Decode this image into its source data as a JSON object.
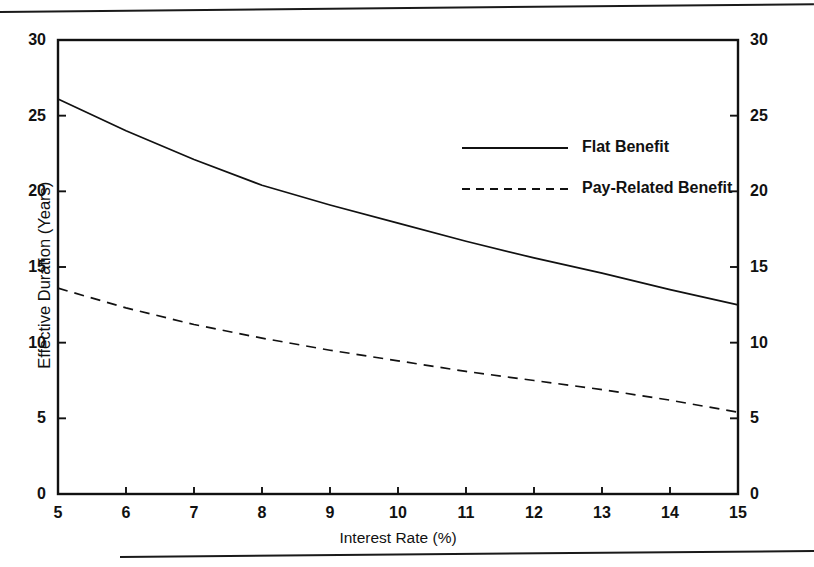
{
  "chart_data": {
    "type": "line",
    "title": "",
    "xlabel": "Interest Rate (%)",
    "ylabel": "Effective Duration (Years)",
    "xlim": [
      5,
      15
    ],
    "ylim": [
      0,
      30
    ],
    "grid": false,
    "legend_position": "upper-right-inside",
    "x_ticks": [
      "5",
      "6",
      "7",
      "8",
      "9",
      "10",
      "11",
      "12",
      "13",
      "14",
      "15"
    ],
    "y_ticks": [
      "0",
      "5",
      "10",
      "15",
      "20",
      "25",
      "30"
    ],
    "y_ticks_right": [
      "0",
      "5",
      "10",
      "15",
      "20",
      "25",
      "30"
    ],
    "x": [
      5,
      6,
      7,
      8,
      9,
      10,
      11,
      12,
      13,
      14,
      15
    ],
    "series": [
      {
        "name": "Flat Benefit",
        "style": "solid",
        "color": "#111111",
        "values": [
          26.1,
          24.0,
          22.1,
          20.4,
          19.1,
          17.9,
          16.7,
          15.6,
          14.6,
          13.5,
          12.5
        ]
      },
      {
        "name": "Pay-Related Benefit",
        "style": "dashed",
        "color": "#111111",
        "values": [
          13.6,
          12.3,
          11.2,
          10.3,
          9.5,
          8.8,
          8.1,
          7.5,
          6.9,
          6.2,
          5.4
        ]
      }
    ]
  },
  "legend": {
    "items": [
      {
        "label": "Flat Benefit",
        "style": "solid"
      },
      {
        "label": "Pay-Related Benefit",
        "style": "dashed"
      }
    ]
  },
  "axes": {
    "x_title": "Interest Rate (%)",
    "y_title": "Effective Duration (Years)"
  },
  "colors": {
    "ink": "#111111",
    "background": "#ffffff",
    "rule": "#1a1a1a"
  }
}
